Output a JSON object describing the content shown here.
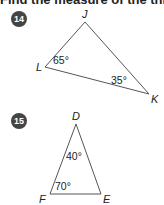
{
  "instruction": "Find the measure of the third angle",
  "problems": [
    {
      "number": "14",
      "vertices": {
        "top": "J",
        "left": "L",
        "right": "K"
      },
      "angles": {
        "L": "65°",
        "K": "35°"
      }
    },
    {
      "number": "15",
      "vertices": {
        "top": "D",
        "left": "F",
        "right": "E"
      },
      "angles": {
        "D": "40°",
        "F": "70°"
      }
    }
  ],
  "colors": {
    "line": "#555555",
    "badge": "#444444",
    "text": "#222222"
  }
}
